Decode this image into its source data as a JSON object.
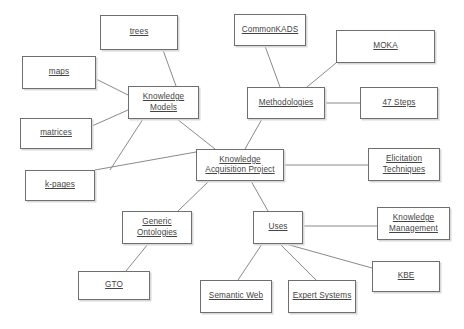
{
  "diagram": {
    "background_color": "#ffffff",
    "node_border_color": "#6f6f6f",
    "node_text_color": "#444444",
    "edge_color": "#8a8a8a",
    "nodes": [
      {
        "id": "trees",
        "lines": [
          "trees"
        ],
        "underline": [
          true
        ],
        "x": 100,
        "y": 15,
        "w": 78,
        "h": 35
      },
      {
        "id": "maps",
        "lines": [
          "maps"
        ],
        "underline": [
          true
        ],
        "x": 22,
        "y": 56,
        "w": 74,
        "h": 33
      },
      {
        "id": "matrices",
        "lines": [
          "matrices"
        ],
        "underline": [
          true
        ],
        "x": 20,
        "y": 118,
        "w": 72,
        "h": 31
      },
      {
        "id": "kpages",
        "lines": [
          "k-pages"
        ],
        "underline": [
          true
        ],
        "x": 25,
        "y": 170,
        "w": 70,
        "h": 31
      },
      {
        "id": "knowmodels",
        "lines": [
          "Knowledge",
          "Models"
        ],
        "underline": [
          true,
          true
        ],
        "x": 128,
        "y": 86,
        "w": 71,
        "h": 33
      },
      {
        "id": "commonkads",
        "lines": [
          "CommonKADS"
        ],
        "underline": [
          true
        ],
        "x": 234,
        "y": 14,
        "w": 72,
        "h": 32
      },
      {
        "id": "moka",
        "lines": [
          "MOKA"
        ],
        "underline": [
          true
        ],
        "x": 336,
        "y": 30,
        "w": 99,
        "h": 33
      },
      {
        "id": "methodologies",
        "lines": [
          "Methodologies"
        ],
        "underline": [
          true
        ],
        "x": 247,
        "y": 87,
        "w": 78,
        "h": 32
      },
      {
        "id": "steps47",
        "lines": [
          "47 Steps"
        ],
        "underline": [
          true
        ],
        "x": 360,
        "y": 87,
        "w": 78,
        "h": 32
      },
      {
        "id": "kap",
        "lines": [
          "Knowledge",
          "Acquisition Project"
        ],
        "underline": [
          true,
          true
        ],
        "x": 196,
        "y": 149,
        "w": 88,
        "h": 32
      },
      {
        "id": "elicitation",
        "lines": [
          "Elicitation",
          "Techniques"
        ],
        "underline": [
          true,
          true
        ],
        "x": 368,
        "y": 148,
        "w": 72,
        "h": 33
      },
      {
        "id": "genericont",
        "lines": [
          "Generic",
          "Ontologies"
        ],
        "underline": [
          true,
          true
        ],
        "x": 122,
        "y": 211,
        "w": 70,
        "h": 33
      },
      {
        "id": "uses",
        "lines": [
          "Uses"
        ],
        "underline": [
          true
        ],
        "x": 253,
        "y": 211,
        "w": 50,
        "h": 33
      },
      {
        "id": "knowmgmt",
        "lines": [
          "Knowledge",
          "Management"
        ],
        "underline": [
          true,
          true
        ],
        "x": 377,
        "y": 207,
        "w": 73,
        "h": 33
      },
      {
        "id": "kbe",
        "lines": [
          "KBE"
        ],
        "underline": [
          true
        ],
        "x": 372,
        "y": 261,
        "w": 68,
        "h": 31
      },
      {
        "id": "gto",
        "lines": [
          "GTO"
        ],
        "underline": [
          true
        ],
        "x": 78,
        "y": 271,
        "w": 72,
        "h": 29
      },
      {
        "id": "semanticweb",
        "lines": [
          "Semantic Web"
        ],
        "underline": [
          true
        ],
        "x": 200,
        "y": 280,
        "w": 72,
        "h": 33
      },
      {
        "id": "expertsystems",
        "lines": [
          "Expert Systems"
        ],
        "underline": [
          true
        ],
        "x": 288,
        "y": 280,
        "w": 68,
        "h": 33
      }
    ],
    "edges": [
      {
        "from": "trees",
        "to": "knowmodels",
        "x1": 163,
        "y1": 50,
        "x2": 176,
        "y2": 86
      },
      {
        "from": "maps",
        "to": "knowmodels",
        "x1": 96,
        "y1": 79,
        "x2": 128,
        "y2": 95
      },
      {
        "from": "matrices",
        "to": "knowmodels",
        "x1": 92,
        "y1": 126,
        "x2": 128,
        "y2": 110
      },
      {
        "from": "kpages",
        "to": "kap",
        "x1": 95,
        "y1": 170,
        "x2": 196,
        "y2": 152
      },
      {
        "from": "knowmodels",
        "to": "kap",
        "x1": 177,
        "y1": 119,
        "x2": 215,
        "y2": 149
      },
      {
        "from": "knowmodels",
        "to": "kpages-branch",
        "x1": 143,
        "y1": 119,
        "x2": 110,
        "y2": 170
      },
      {
        "from": "commonkads",
        "to": "methodologies",
        "x1": 265,
        "y1": 46,
        "x2": 280,
        "y2": 87
      },
      {
        "from": "moka",
        "to": "methodologies",
        "x1": 336,
        "y1": 63,
        "x2": 307,
        "y2": 87
      },
      {
        "from": "methodologies",
        "to": "steps47",
        "x1": 325,
        "y1": 103,
        "x2": 360,
        "y2": 103
      },
      {
        "from": "methodologies",
        "to": "kap",
        "x1": 262,
        "y1": 119,
        "x2": 245,
        "y2": 149
      },
      {
        "from": "kap",
        "to": "elicitation",
        "x1": 284,
        "y1": 165,
        "x2": 368,
        "y2": 165
      },
      {
        "from": "kap",
        "to": "genericont",
        "x1": 209,
        "y1": 181,
        "x2": 178,
        "y2": 211
      },
      {
        "from": "kap",
        "to": "uses",
        "x1": 251,
        "y1": 181,
        "x2": 268,
        "y2": 211
      },
      {
        "from": "genericont",
        "to": "gto",
        "x1": 148,
        "y1": 244,
        "x2": 126,
        "y2": 271
      },
      {
        "from": "uses",
        "to": "knowmgmt",
        "x1": 303,
        "y1": 226,
        "x2": 377,
        "y2": 226
      },
      {
        "from": "uses",
        "to": "kbe",
        "x1": 286,
        "y1": 244,
        "x2": 372,
        "y2": 268
      },
      {
        "from": "uses",
        "to": "semanticweb",
        "x1": 262,
        "y1": 244,
        "x2": 238,
        "y2": 280
      },
      {
        "from": "uses",
        "to": "expertsystems",
        "x1": 280,
        "y1": 244,
        "x2": 316,
        "y2": 280
      }
    ]
  }
}
